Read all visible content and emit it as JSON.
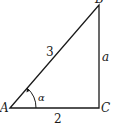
{
  "diagram": {
    "type": "right-triangle",
    "vertices": {
      "A": {
        "label": "A",
        "x": 10,
        "y": 108
      },
      "B": {
        "label": "B",
        "x": 99,
        "y": 5
      },
      "C": {
        "label": "C",
        "x": 99,
        "y": 108
      }
    },
    "sides": {
      "hypotenuse_AB": {
        "label": "3"
      },
      "vertical_BC": {
        "label": "a"
      },
      "base_AC": {
        "label": "2"
      }
    },
    "angle": {
      "vertex": "A",
      "label": "α"
    },
    "colors": {
      "stroke": "#1a1a1a",
      "background": "#ffffff"
    }
  }
}
